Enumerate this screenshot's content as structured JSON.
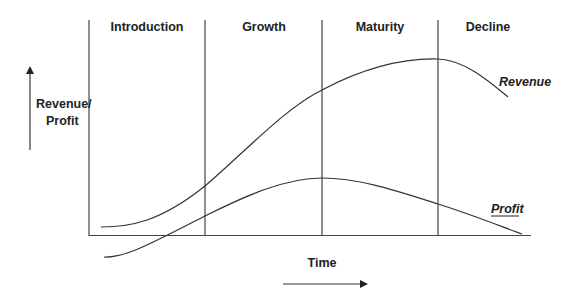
{
  "diagram": {
    "stages": [
      {
        "label": "Introduction"
      },
      {
        "label": "Growth"
      },
      {
        "label": "Maturity"
      },
      {
        "label": "Decline"
      }
    ],
    "y_axis_label_line1": "Revenue/",
    "y_axis_label_line2": "Profit",
    "x_axis_label": "Time",
    "curves": {
      "revenue_label": "Revenue",
      "profit_label": "Profit"
    },
    "colors": {
      "line": "#333333",
      "text": "#222222",
      "background": "#ffffff"
    }
  }
}
